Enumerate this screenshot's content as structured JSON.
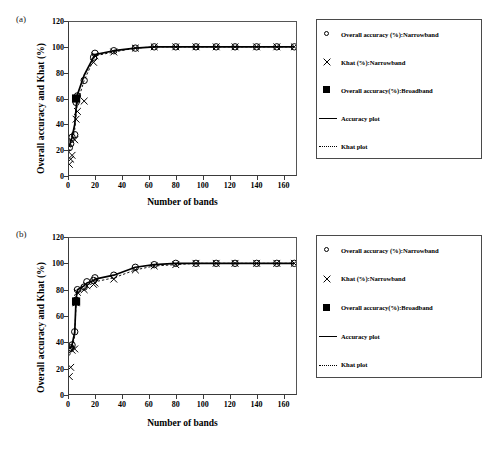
{
  "figure": {
    "panels": [
      {
        "tag": "(a)",
        "ylabel": "Overall accuracy and Khat (%)",
        "xlabel": "Number of bands",
        "yticks": [
          "0",
          "20",
          "40",
          "60",
          "80",
          "100",
          "120"
        ],
        "xticks": [
          "0",
          "20",
          "40",
          "60",
          "80",
          "100",
          "120",
          "140",
          "160"
        ]
      },
      {
        "tag": "(b)",
        "ylabel": "Overall accuracy and Khat (%)",
        "xlabel": "Number of bands",
        "yticks": [
          "0",
          "20",
          "40",
          "60",
          "80",
          "100",
          "120"
        ],
        "xticks": [
          "0",
          "20",
          "40",
          "60",
          "80",
          "100",
          "120",
          "140",
          "160"
        ]
      }
    ],
    "legend": {
      "entries": [
        {
          "key": "open-circle",
          "label": "Overall accuracy (%):Narrowband"
        },
        {
          "key": "cross",
          "label": "Khat (%):Narrowband"
        },
        {
          "key": "filled-square",
          "label": "Overall accuracy(%):Broadband"
        },
        {
          "key": "solid-line",
          "label": "Accuracy plot"
        },
        {
          "key": "dotted-line",
          "label": "Khat plot"
        }
      ]
    }
  },
  "chart_data": [
    {
      "type": "scatter",
      "panel": "(a)",
      "title": "",
      "xlabel": "Number of bands",
      "ylabel": "Overall accuracy and Khat (%)",
      "xlim": [
        0,
        170
      ],
      "ylim": [
        0,
        120
      ],
      "xticks": [
        0,
        20,
        40,
        60,
        80,
        100,
        120,
        140,
        160
      ],
      "yticks": [
        0,
        20,
        40,
        60,
        80,
        100,
        120
      ],
      "grid": false,
      "legend_position": "right-outside",
      "series": [
        {
          "name": "Overall accuracy (%):Narrowband",
          "marker": "open-circle",
          "x": [
            1,
            2,
            3,
            5,
            6,
            7,
            12,
            19,
            20,
            34,
            50,
            64,
            80,
            95,
            110,
            124,
            140,
            155,
            168
          ],
          "y": [
            22,
            25,
            30,
            32,
            57,
            62,
            74,
            92,
            95,
            97,
            99,
            100,
            100,
            100,
            100,
            100,
            100,
            100,
            100
          ]
        },
        {
          "name": "Khat (%):Narrowband",
          "marker": "cross",
          "x": [
            1,
            2,
            3,
            5,
            6,
            7,
            12,
            19,
            20,
            34,
            50,
            64,
            80,
            95,
            110,
            124,
            140,
            155,
            168
          ],
          "y": [
            9,
            13,
            16,
            28,
            44,
            50,
            58,
            88,
            93,
            96,
            99,
            100,
            100,
            100,
            100,
            100,
            100,
            100,
            100
          ]
        },
        {
          "name": "Overall accuracy(%):Broadband",
          "marker": "filled-square",
          "x": [
            6
          ],
          "y": [
            60
          ]
        },
        {
          "name": "Accuracy plot",
          "marker": "solid-line",
          "x": [
            1,
            2,
            3,
            5,
            6,
            7,
            12,
            19,
            20,
            34,
            50,
            64,
            80,
            95,
            110,
            124,
            140,
            155,
            168
          ],
          "y": [
            23,
            27,
            30,
            40,
            52,
            63,
            78,
            92,
            94,
            97,
            99,
            100,
            100,
            100,
            100,
            100,
            100,
            100,
            100
          ]
        },
        {
          "name": "Khat plot",
          "marker": "dotted-line",
          "x": [
            1,
            2,
            3,
            5,
            6,
            7,
            12,
            19,
            20,
            34,
            50,
            64,
            80,
            95,
            110,
            124,
            140,
            155,
            168
          ],
          "y": [
            19,
            23,
            27,
            36,
            47,
            57,
            74,
            90,
            93,
            96,
            99,
            100,
            100,
            100,
            100,
            100,
            100,
            100,
            100
          ]
        }
      ]
    },
    {
      "type": "scatter",
      "panel": "(b)",
      "title": "",
      "xlabel": "Number of bands",
      "ylabel": "Overall accuracy and Khat (%)",
      "xlim": [
        0,
        170
      ],
      "ylim": [
        0,
        120
      ],
      "xticks": [
        0,
        20,
        40,
        60,
        80,
        100,
        120,
        140,
        160
      ],
      "yticks": [
        0,
        20,
        40,
        60,
        80,
        100,
        120
      ],
      "grid": false,
      "legend_position": "right-outside",
      "series": [
        {
          "name": "Overall accuracy (%):Narrowband",
          "marker": "open-circle",
          "x": [
            1,
            2,
            3,
            5,
            6,
            7,
            12,
            14,
            19,
            20,
            34,
            50,
            64,
            80,
            95,
            110,
            124,
            140,
            155,
            168
          ],
          "y": [
            35,
            36,
            38,
            48,
            72,
            80,
            82,
            86,
            87,
            89,
            91,
            97,
            99,
            100,
            100,
            100,
            100,
            100,
            100,
            100
          ]
        },
        {
          "name": "Khat (%):Narrowband",
          "marker": "cross",
          "x": [
            1,
            2,
            3,
            5,
            6,
            7,
            12,
            14,
            19,
            20,
            34,
            50,
            64,
            80,
            95,
            110,
            124,
            140,
            155,
            168
          ],
          "y": [
            14,
            21,
            34,
            35,
            70,
            78,
            80,
            83,
            84,
            85,
            88,
            95,
            98,
            99,
            100,
            100,
            100,
            100,
            100,
            100
          ]
        },
        {
          "name": "Overall accuracy(%):Broadband",
          "marker": "filled-square",
          "x": [
            6
          ],
          "y": [
            71
          ]
        },
        {
          "name": "Accuracy plot",
          "marker": "solid-line",
          "x": [
            1,
            2,
            3,
            5,
            6,
            7,
            12,
            14,
            19,
            20,
            34,
            50,
            64,
            80,
            95,
            110,
            124,
            140,
            155,
            168
          ],
          "y": [
            35,
            36,
            38,
            48,
            73,
            80,
            83,
            85,
            87,
            88,
            91,
            97,
            99,
            100,
            100,
            100,
            100,
            100,
            100,
            100
          ]
        },
        {
          "name": "Khat plot",
          "marker": "dotted-line",
          "x": [
            1,
            2,
            3,
            5,
            6,
            7,
            12,
            14,
            19,
            20,
            34,
            50,
            64,
            80,
            95,
            110,
            124,
            140,
            155,
            168
          ],
          "y": [
            30,
            32,
            35,
            45,
            70,
            78,
            80,
            83,
            85,
            86,
            89,
            95,
            98,
            99,
            100,
            100,
            100,
            100,
            100,
            100
          ]
        }
      ]
    }
  ]
}
